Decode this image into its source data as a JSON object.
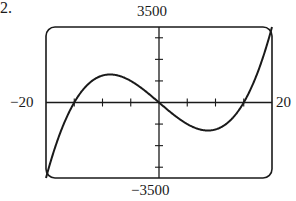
{
  "problem": {
    "number_label": "2."
  },
  "chart_data": {
    "type": "line",
    "title": "",
    "xlabel": "",
    "ylabel": "",
    "function": "f(x) = x^3 - 225x",
    "xlim": [
      -20,
      20
    ],
    "ylim": [
      -3500,
      3500
    ],
    "x_tick_step": 5,
    "y_tick_step": 1000,
    "grid": false,
    "window_labels": {
      "xmin": "−20",
      "xmax": "20",
      "ymin": "−3500",
      "ymax": "3500"
    },
    "key_points": {
      "x_intercepts": [
        -15,
        0,
        15
      ],
      "local_max": [
        -8.66,
        1299
      ],
      "local_min": [
        8.66,
        -1299
      ],
      "endpoints": [
        [
          -20,
          -3500
        ],
        [
          20,
          3500
        ]
      ]
    },
    "series": [
      {
        "name": "f(x)",
        "x": [
          -20,
          -18,
          -16,
          -15,
          -14,
          -12,
          -10,
          -8.66,
          -8,
          -6,
          -4,
          -2,
          0,
          2,
          4,
          6,
          8,
          8.66,
          10,
          12,
          14,
          15,
          16,
          18,
          20
        ],
        "values": [
          -3500,
          -1782,
          -496,
          0,
          406,
          972,
          1250,
          1299,
          1288,
          1134,
          836,
          442,
          0,
          -442,
          -836,
          -1134,
          -1288,
          -1299,
          -1250,
          -972,
          -406,
          0,
          496,
          1782,
          3500
        ]
      }
    ]
  },
  "style": {
    "line_color": "#1a1a1a",
    "frame_color": "#1a1a1a"
  }
}
